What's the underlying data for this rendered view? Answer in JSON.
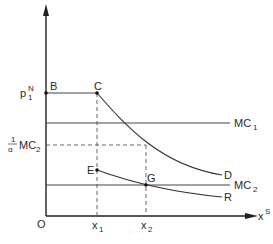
{
  "diagram": {
    "axes": {
      "y_label_price": "p",
      "y_label_price_sup": "N",
      "y_label_price_sub": "1",
      "y_label_mc": "MC",
      "y_label_mc_sub": "2",
      "y_label_frac_num": "1",
      "y_label_frac_den": "α",
      "origin": "O",
      "x_axis_label": "x",
      "x_axis_sup": "S",
      "x1_label": "x",
      "x1_sub": "1",
      "x2_label": "x",
      "x2_sub": "2"
    },
    "points": {
      "B": "B",
      "C": "C",
      "E": "E",
      "G": "G"
    },
    "curves": {
      "MC1": "MC",
      "MC1_sub": "1",
      "MC2": "MC",
      "MC2_sub": "2",
      "D": "D",
      "R": "R"
    }
  }
}
